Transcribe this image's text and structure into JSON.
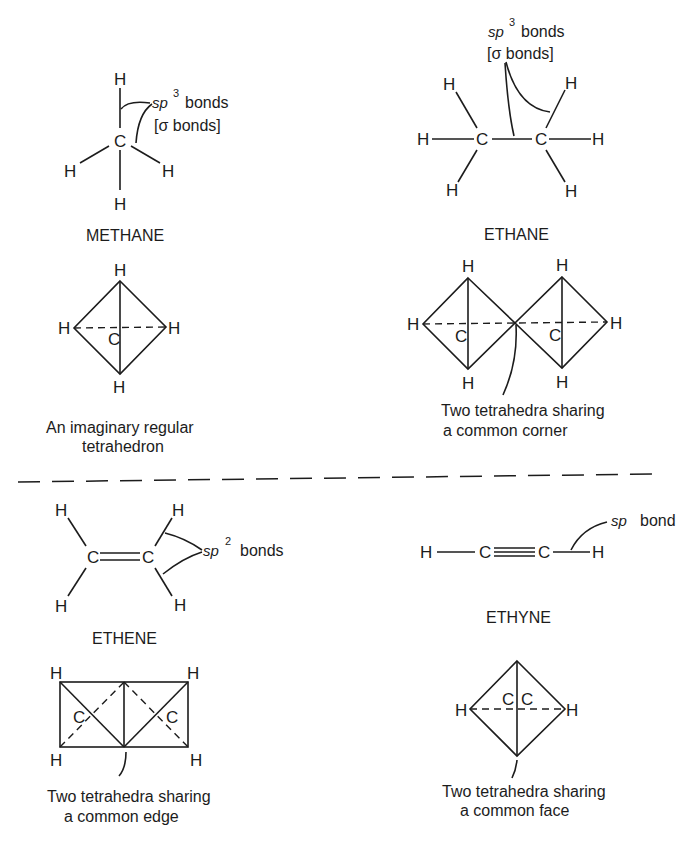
{
  "atoms": {
    "H": "H",
    "C": "C"
  },
  "methane": {
    "name": "METHANE",
    "annotation": {
      "sp": "sp",
      "exp": "3",
      "word": "bonds",
      "line2": "[σ bonds]"
    },
    "tetra_caption": [
      "An imaginary regular",
      "tetrahedron"
    ]
  },
  "ethane": {
    "name": "ETHANE",
    "annotation": {
      "sp": "sp",
      "exp": "3",
      "word": "bonds",
      "line2": "[σ bonds]"
    },
    "tetra_caption": [
      "Two tetrahedra sharing",
      "a common corner"
    ]
  },
  "ethene": {
    "name": "ETHENE",
    "annotation": {
      "sp": "sp",
      "exp": "2",
      "word": "bonds"
    },
    "tetra_caption": [
      "Two tetrahedra sharing",
      "a common edge"
    ]
  },
  "ethyne": {
    "name": "ETHYNE",
    "annotation": {
      "sp": "sp",
      "word": "bond"
    },
    "tetra_caption": [
      "Two tetrahedra sharing",
      "a common face"
    ]
  },
  "colors": {
    "ink": "#1c1c1c",
    "paper": "#ffffff"
  }
}
